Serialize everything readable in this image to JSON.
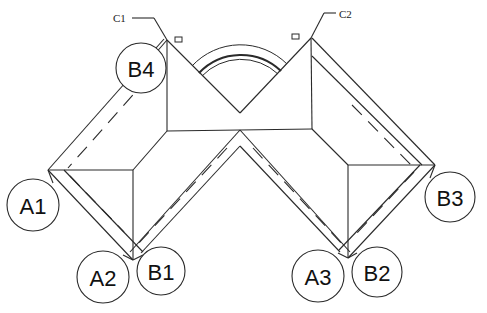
{
  "diagram": {
    "type": "structural-plan",
    "callouts": [
      {
        "id": "c1",
        "label": "C1"
      },
      {
        "id": "c2",
        "label": "C2"
      }
    ],
    "bubbles": [
      {
        "id": "b4",
        "label": "B4"
      },
      {
        "id": "a1",
        "label": "A1"
      },
      {
        "id": "a2",
        "label": "A2"
      },
      {
        "id": "b1",
        "label": "B1"
      },
      {
        "id": "a3",
        "label": "A3"
      },
      {
        "id": "b2",
        "label": "B2"
      },
      {
        "id": "b3",
        "label": "B3"
      }
    ],
    "colors": {
      "line": "#2a2a2a",
      "background": "#ffffff",
      "text": "#111111"
    }
  }
}
